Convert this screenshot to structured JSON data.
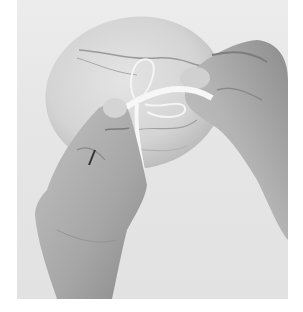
{
  "image": {
    "description": "Two hands tying a white satin ribbon bow onto a round marbled disc ornament against a light gray background, black and white photo",
    "colors": {
      "frame": "#ffffff",
      "background": "#e6e6e6",
      "disc": "#d8d8d8",
      "marble_vein": "#9a9a9a",
      "ribbon": "#f7f7f7",
      "skin_light": "#c9c9c9",
      "skin_mid": "#a9a9a9",
      "skin_dark": "#6f6f6f"
    }
  }
}
